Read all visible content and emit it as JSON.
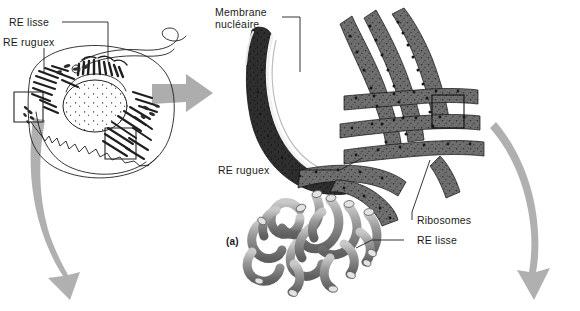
{
  "figure": {
    "panel_label": "(a)",
    "background_color": "#ffffff",
    "ink_color": "#1a1a1a",
    "arrow_color": "#a8a8a8"
  },
  "labels": {
    "re_lisse_left": "RE lisse",
    "re_rugueux_left": "RE ruguex",
    "membrane_nucleaire": "Membrane\nnucléaire",
    "membrane_nucleaire_line1": "Membrane",
    "membrane_nucleaire_line2": "nucléaire",
    "re_rugueux_right": "RE ruguex",
    "ribosomes": "Ribosomes",
    "re_lisse_right": "RE lisse"
  },
  "diagrams": {
    "overview": {
      "name": "whole-cell-overview",
      "description": "Line drawing of a whole cell showing nucleus, rough ER and smooth ER",
      "callout_boxes": 2
    },
    "detail": {
      "name": "er-detail-micrograph",
      "description": "Shaded drawing of nuclear membrane, rough ER cisternae with ribosomes, and smooth ER tubules",
      "callout_boxes": 1
    }
  },
  "arrows": [
    {
      "name": "arrow-overview-to-detail",
      "direction": "right"
    },
    {
      "name": "arrow-left-zoom-out",
      "direction": "down-left"
    },
    {
      "name": "arrow-right-zoom-out",
      "direction": "down"
    }
  ]
}
